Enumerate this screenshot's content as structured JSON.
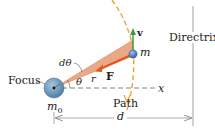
{
  "diagram": {
    "labels": {
      "focus": "Focus",
      "directrix": "Directrix",
      "path": "Path",
      "mass_focus": "m",
      "mass_focus_sub": "0",
      "mass": "m",
      "velocity": "v",
      "force": "F",
      "radius": "r",
      "theta": "θ",
      "dtheta": "dθ",
      "x_axis": "x",
      "distance": "d"
    },
    "colors": {
      "wedge": "#e8a27c",
      "force_arrow": "#e05a1e",
      "velocity_arrow": "#3a9a4a",
      "path": "#f0a030",
      "focus_body": "#6e9cc0",
      "mass_body": "#4f7fb8",
      "lines": "#555555"
    }
  }
}
